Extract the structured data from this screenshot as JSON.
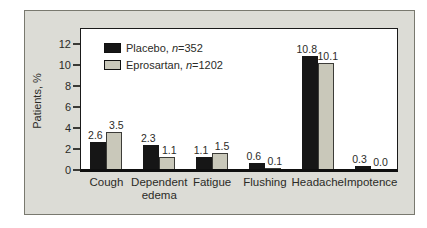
{
  "figure": {
    "ylabel": "Patients, %",
    "legend": [
      {
        "pre": "Placebo, ",
        "n": "n",
        "post": "=352"
      },
      {
        "pre": "Eprosartan, ",
        "n": "n",
        "post": "=1202"
      }
    ],
    "colors": {
      "panel_background": "#dcdcd6",
      "plot_background": "#ffffff",
      "placebo_bar": "#161616",
      "eprosartan_bar": "#c9c8ba",
      "axis": "#0f0f0f"
    }
  },
  "chart_data": {
    "type": "bar",
    "title": "",
    "xlabel": "",
    "ylabel": "Patients, %",
    "ylim": [
      0,
      12
    ],
    "yticks": [
      0,
      2,
      4,
      6,
      8,
      10,
      12
    ],
    "grid": false,
    "legend_position": "top-left-inside",
    "categories": [
      "Cough",
      "Dependent edema",
      "Fatigue",
      "Flushing",
      "Headache",
      "Impotence"
    ],
    "series": [
      {
        "name": "Placebo, n=352",
        "color": "#161616",
        "values": [
          2.6,
          2.3,
          1.1,
          0.6,
          10.8,
          0.3
        ],
        "labels": [
          "2.6",
          "2.3",
          "1.1",
          "0.6",
          "10.8",
          "0.3"
        ]
      },
      {
        "name": "Eprosartan, n=1202",
        "color": "#c9c8ba",
        "values": [
          3.5,
          1.1,
          1.5,
          0.1,
          10.1,
          0.0
        ],
        "labels": [
          "3.5",
          "1.1",
          "1.5",
          "0.1",
          "10.1",
          "0.0"
        ]
      }
    ]
  }
}
